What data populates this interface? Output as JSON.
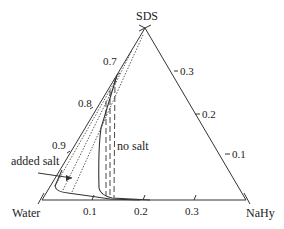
{
  "diagram": {
    "type": "ternary-phase-diagram",
    "vertices": {
      "top": "SDS",
      "bottom_left": "Water",
      "bottom_right": "NaHy"
    },
    "left_axis_ticks": [
      "0.7",
      "0.8",
      "0.9"
    ],
    "right_axis_ticks": [
      "0.3",
      "0.2",
      "0.1"
    ],
    "bottom_axis_ticks": [
      "0.1",
      "0.2",
      "0.3"
    ],
    "annotations": {
      "added_salt": "added salt",
      "no_salt": "no salt"
    },
    "colors": {
      "line": "#333333",
      "background": "#ffffff"
    }
  }
}
